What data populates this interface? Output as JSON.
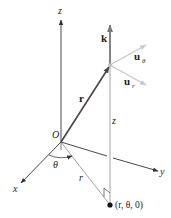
{
  "diagram": {
    "type": "cylindrical-coordinates-unit-vectors",
    "axes": {
      "x_label": "x",
      "y_label": "y",
      "z_label": "z"
    },
    "origin_label": "O",
    "vectors": {
      "position_label": "r",
      "k_label": "k",
      "u_r_label": "u",
      "u_r_sub": "r",
      "u_theta_label": "u",
      "u_theta_sub": "θ"
    },
    "annotations": {
      "angle_label": "θ",
      "radius_label": "r",
      "height_label": "z",
      "projection_point_label": "(r, θ, 0)"
    },
    "colors": {
      "axis": "#333333",
      "position_vector": "#444444",
      "k_vector": "#777777",
      "unit_vectors": "#c8c8c8",
      "guide_lines": "#9a9a9a",
      "point": "#111111"
    }
  }
}
